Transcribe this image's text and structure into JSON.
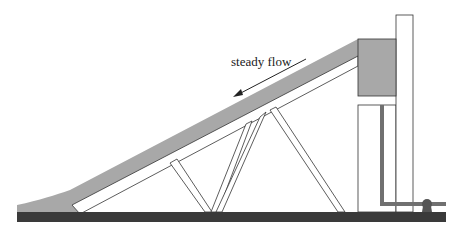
{
  "diagram": {
    "flow_label": "steady flow",
    "colors": {
      "water": "#a8a8a8",
      "ground": "#3a3a3a",
      "outline": "#333333",
      "pipe": "#707070",
      "background": "#ffffff"
    }
  }
}
